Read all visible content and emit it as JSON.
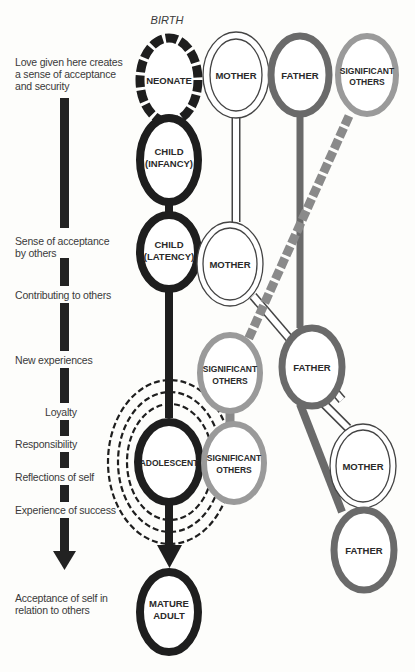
{
  "diagram": {
    "type": "developmental-relationship-diagram",
    "start_label": "BIRTH",
    "left_labels": [
      {
        "id": "love",
        "lines": [
          "Love given here creates",
          "a sense of acceptance",
          "and security"
        ]
      },
      {
        "id": "acceptance",
        "lines": [
          "Sense of acceptance",
          "by others"
        ]
      },
      {
        "id": "contributing",
        "lines": [
          "Contributing to others"
        ]
      },
      {
        "id": "new-exp",
        "lines": [
          "New experiences"
        ]
      },
      {
        "id": "loyalty",
        "lines": [
          "Loyalty"
        ]
      },
      {
        "id": "responsibility",
        "lines": [
          "Responsibility"
        ]
      },
      {
        "id": "reflections",
        "lines": [
          "Reflections of self"
        ]
      },
      {
        "id": "success",
        "lines": [
          "Experience of success"
        ]
      },
      {
        "id": "self-accept",
        "lines": [
          "Acceptance of self in",
          "relation to others"
        ]
      }
    ],
    "nodes": {
      "neonate": {
        "lines": [
          "NEONATE"
        ]
      },
      "mother1": {
        "lines": [
          "MOTHER"
        ]
      },
      "father1": {
        "lines": [
          "FATHER"
        ]
      },
      "sig1": {
        "lines": [
          "SIGNIFICANT",
          "OTHERS"
        ]
      },
      "child_inf": {
        "lines": [
          "CHILD",
          "(INFANCY)"
        ]
      },
      "child_lat": {
        "lines": [
          "CHILD",
          "(LATENCY)"
        ]
      },
      "mother2": {
        "lines": [
          "MOTHER"
        ]
      },
      "sig2": {
        "lines": [
          "SIGNIFICANT",
          "OTHERS"
        ]
      },
      "father2": {
        "lines": [
          "FATHER"
        ]
      },
      "adolescent": {
        "lines": [
          "ADOLESCENT"
        ]
      },
      "sig3": {
        "lines": [
          "SIGNIFICANT",
          "OTHERS"
        ]
      },
      "mother3": {
        "lines": [
          "MOTHER"
        ]
      },
      "father3": {
        "lines": [
          "FATHER"
        ]
      },
      "adult": {
        "lines": [
          "MATURE",
          "ADULT"
        ]
      }
    },
    "colors": {
      "self": "#1e1e1e",
      "mother": "#ffffff",
      "mother_outline": "#444444",
      "father": "#6a6a6a",
      "significant": "#9a9a9a",
      "text": "#2a2a2a"
    }
  }
}
